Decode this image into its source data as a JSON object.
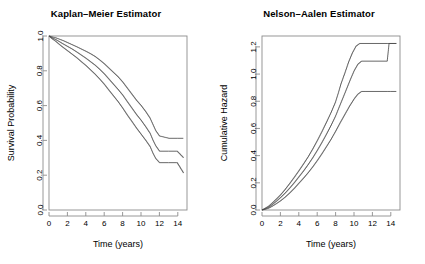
{
  "figure": {
    "background": "#ffffff",
    "line_color": "#4d4d4d",
    "axis_color": "#8c8c8c"
  },
  "panels": {
    "km": {
      "title": "Kaplan–Meier Estimator",
      "xlabel": "Time (years)",
      "ylabel": "Survival Probability",
      "x_ticks": [
        "0",
        "2",
        "4",
        "6",
        "8",
        "10",
        "12",
        "14"
      ],
      "y_ticks": [
        "0.0",
        "0.2",
        "0.4",
        "0.6",
        "0.8",
        "1.0"
      ]
    },
    "na": {
      "title": "Nelson–Aalen Estimator",
      "xlabel": "Time (years)",
      "ylabel": "Cumulative Hazard",
      "x_ticks": [
        "0",
        "2",
        "4",
        "6",
        "8",
        "10",
        "12",
        "14"
      ],
      "y_ticks": [
        "0.0",
        "0.2",
        "0.4",
        "0.6",
        "0.8",
        "1.0",
        "1.2"
      ]
    }
  },
  "chart_data": [
    {
      "type": "line",
      "title": "Kaplan–Meier Estimator",
      "xlabel": "Time (years)",
      "ylabel": "Survival Probability",
      "xlim": [
        0,
        15
      ],
      "ylim": [
        0.0,
        1.0
      ],
      "xticks": [
        0,
        2,
        4,
        6,
        8,
        10,
        12,
        14
      ],
      "yticks": [
        0.0,
        0.2,
        0.4,
        0.6,
        0.8,
        1.0
      ],
      "grid": false,
      "legend": "none",
      "step": "post",
      "series": [
        {
          "name": "Upper 95% confidence limit",
          "x": [
            0,
            0.3,
            0.7,
            1.1,
            1.5,
            2.0,
            2.5,
            3.0,
            3.5,
            4.0,
            4.5,
            5.0,
            5.5,
            6.0,
            6.5,
            7.0,
            7.5,
            8.0,
            8.5,
            9.0,
            9.5,
            10.0,
            10.5,
            11.0,
            11.3,
            11.6,
            12.0,
            13.0,
            14.0,
            14.6
          ],
          "y": [
            1.0,
            0.995,
            0.99,
            0.982,
            0.974,
            0.962,
            0.95,
            0.938,
            0.925,
            0.912,
            0.898,
            0.882,
            0.862,
            0.84,
            0.815,
            0.79,
            0.765,
            0.735,
            0.7,
            0.665,
            0.63,
            0.6,
            0.565,
            0.525,
            0.49,
            0.455,
            0.425,
            0.412,
            0.412,
            0.412
          ]
        },
        {
          "name": "Estimate",
          "x": [
            0,
            0.3,
            0.7,
            1.1,
            1.5,
            2.0,
            2.5,
            3.0,
            3.5,
            4.0,
            4.5,
            5.0,
            5.5,
            6.0,
            6.5,
            7.0,
            7.5,
            8.0,
            8.5,
            9.0,
            9.5,
            10.0,
            10.5,
            11.0,
            11.3,
            11.6,
            12.0,
            13.0,
            13.9,
            14.6
          ],
          "y": [
            1.0,
            0.99,
            0.98,
            0.968,
            0.955,
            0.94,
            0.925,
            0.908,
            0.89,
            0.872,
            0.852,
            0.832,
            0.808,
            0.782,
            0.752,
            0.722,
            0.692,
            0.66,
            0.622,
            0.585,
            0.548,
            0.515,
            0.478,
            0.438,
            0.4,
            0.368,
            0.338,
            0.338,
            0.338,
            0.3
          ]
        },
        {
          "name": "Lower 95% confidence limit",
          "x": [
            0,
            0.3,
            0.7,
            1.1,
            1.5,
            2.0,
            2.5,
            3.0,
            3.5,
            4.0,
            4.5,
            5.0,
            5.5,
            6.0,
            6.5,
            7.0,
            7.5,
            8.0,
            8.5,
            9.0,
            9.5,
            10.0,
            10.5,
            11.0,
            11.3,
            11.6,
            12.0,
            13.0,
            13.9,
            14.6
          ],
          "y": [
            1.0,
            0.985,
            0.97,
            0.952,
            0.935,
            0.915,
            0.895,
            0.875,
            0.852,
            0.83,
            0.805,
            0.78,
            0.752,
            0.722,
            0.688,
            0.655,
            0.622,
            0.585,
            0.545,
            0.508,
            0.47,
            0.435,
            0.4,
            0.362,
            0.325,
            0.295,
            0.272,
            0.272,
            0.272,
            0.212
          ]
        }
      ]
    },
    {
      "type": "line",
      "title": "Nelson–Aalen Estimator",
      "xlabel": "Time (years)",
      "ylabel": "Cumulative Hazard",
      "xlim": [
        0,
        15
      ],
      "ylim": [
        0.0,
        1.28
      ],
      "xticks": [
        0,
        2,
        4,
        6,
        8,
        10,
        12,
        14
      ],
      "yticks": [
        0.0,
        0.2,
        0.4,
        0.6,
        0.8,
        1.0,
        1.2
      ],
      "grid": false,
      "legend": "none",
      "step": "post",
      "series": [
        {
          "name": "Upper 95% confidence limit",
          "x": [
            0,
            0.3,
            0.7,
            1.1,
            1.5,
            2.0,
            2.5,
            3.0,
            3.5,
            4.0,
            4.5,
            5.0,
            5.5,
            6.0,
            6.5,
            7.0,
            7.5,
            8.0,
            8.3,
            8.6,
            9.0,
            9.4,
            9.8,
            10.2,
            10.6,
            13.6,
            13.7,
            14.6
          ],
          "y": [
            0.0,
            0.012,
            0.028,
            0.052,
            0.078,
            0.112,
            0.152,
            0.196,
            0.242,
            0.29,
            0.34,
            0.392,
            0.45,
            0.512,
            0.578,
            0.648,
            0.72,
            0.8,
            0.865,
            0.935,
            1.01,
            1.09,
            1.155,
            1.205,
            1.225,
            1.225,
            1.225,
            1.225
          ]
        },
        {
          "name": "Estimate",
          "x": [
            0,
            0.3,
            0.7,
            1.1,
            1.5,
            2.0,
            2.5,
            3.0,
            3.5,
            4.0,
            4.5,
            5.0,
            5.5,
            6.0,
            6.5,
            7.0,
            7.5,
            8.0,
            8.4,
            8.8,
            9.2,
            9.6,
            10.0,
            10.4,
            10.8,
            13.6,
            13.8,
            14.6
          ],
          "y": [
            0.0,
            0.008,
            0.02,
            0.04,
            0.062,
            0.092,
            0.125,
            0.162,
            0.202,
            0.245,
            0.288,
            0.335,
            0.385,
            0.44,
            0.498,
            0.56,
            0.625,
            0.695,
            0.762,
            0.828,
            0.895,
            0.962,
            1.025,
            1.072,
            1.095,
            1.095,
            1.225,
            1.225
          ]
        },
        {
          "name": "Lower 95% confidence limit",
          "x": [
            0,
            0.3,
            0.7,
            1.1,
            1.5,
            2.0,
            2.5,
            3.0,
            3.5,
            4.0,
            4.5,
            5.0,
            5.5,
            6.0,
            6.5,
            7.0,
            7.5,
            8.0,
            8.5,
            9.0,
            9.5,
            10.0,
            10.4,
            10.8,
            11.2,
            13.6,
            14.0,
            14.6
          ],
          "y": [
            0.0,
            0.005,
            0.013,
            0.028,
            0.045,
            0.068,
            0.095,
            0.126,
            0.16,
            0.198,
            0.235,
            0.275,
            0.318,
            0.365,
            0.415,
            0.468,
            0.522,
            0.582,
            0.645,
            0.705,
            0.765,
            0.818,
            0.852,
            0.872,
            0.872,
            0.872,
            0.872,
            0.872
          ]
        }
      ]
    }
  ]
}
